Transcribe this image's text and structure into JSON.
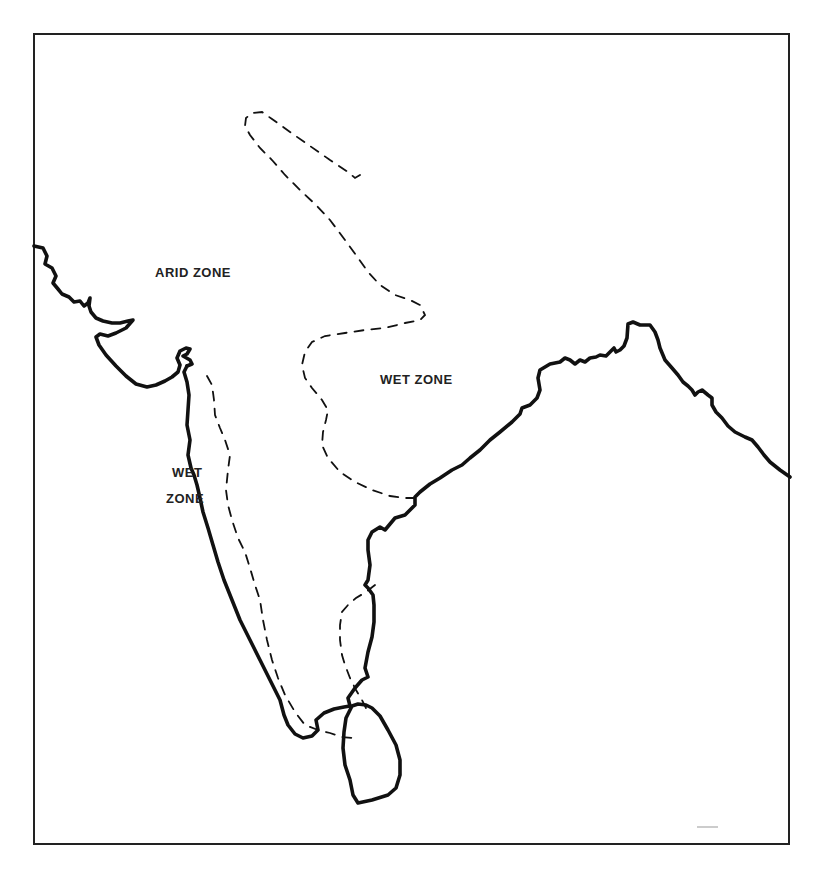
{
  "map": {
    "labels": {
      "arid_zone": "ARID ZONE",
      "wet_zone_north": "WET ZONE",
      "wet_zone_west_line1": "WET",
      "wet_zone_west_line2": "ZONE"
    },
    "colors": {
      "coastline": "#111111",
      "zone_boundary": "#111111",
      "background": "#ffffff"
    }
  }
}
